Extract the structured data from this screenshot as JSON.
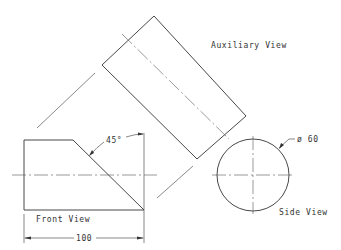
{
  "drawing": {
    "views": {
      "auxiliary": {
        "label": "Auxiliary View"
      },
      "front": {
        "label": "Front View"
      },
      "side": {
        "label": "Side View"
      }
    },
    "dimensions": {
      "angle": "45°",
      "length": "100",
      "diameter": "ø 60"
    },
    "colors": {
      "line": "#333333",
      "background": "#ffffff"
    }
  }
}
